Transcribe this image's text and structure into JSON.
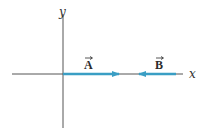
{
  "diagram": {
    "title": "",
    "axes": {
      "x_label": "x",
      "y_label": "y"
    },
    "vectors": [
      {
        "name": "A",
        "label": "A",
        "direction": "+x",
        "tail": "origin",
        "relative_length": 1.0
      },
      {
        "name": "B",
        "label": "B",
        "direction": "-x",
        "tail": "positive x",
        "relative_length": 0.65
      }
    ],
    "colors": {
      "axis": "#555555",
      "vector": "#3a9ec4",
      "label": "#2b2b2b"
    }
  }
}
